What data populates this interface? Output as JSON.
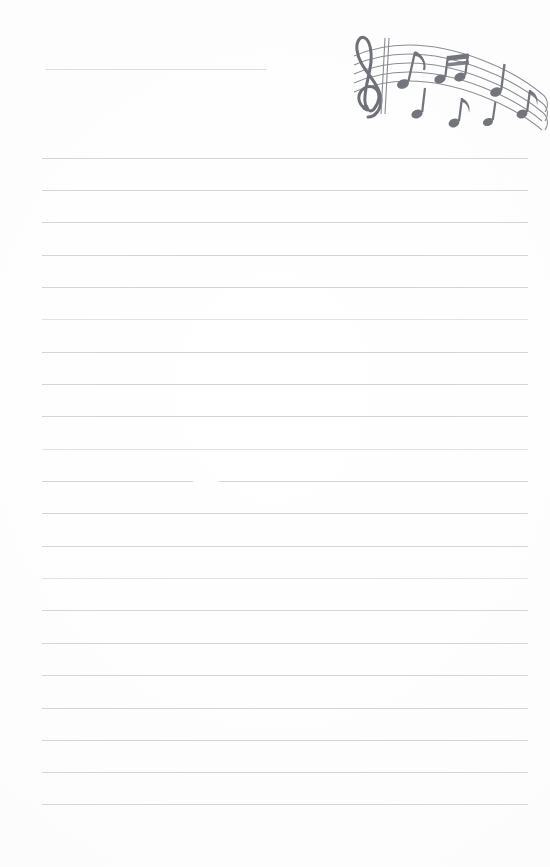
{
  "document": {
    "kind": "lined-notepaper",
    "title_line_label": "",
    "page_width": 550,
    "page_height": 867,
    "background_color": "#fefefe"
  },
  "header": {
    "title_rule": {
      "name": "title-rule",
      "x": 45,
      "y": 69,
      "width": 222,
      "color": "#d9dade"
    }
  },
  "artwork": {
    "name": "music-staff-illustration",
    "description": "Hand-drawn wavy five-line musical staff with treble clef and assorted eighth and quarter notes",
    "ink_color": "#7d7f86",
    "x": 336,
    "y": 22,
    "width": 214,
    "height": 112,
    "elements": [
      {
        "name": "treble-clef-icon",
        "symbol": "G-clef"
      },
      {
        "name": "barline"
      },
      {
        "name": "eighth-note-pair"
      },
      {
        "name": "beamed-sixteenth-notes"
      },
      {
        "name": "quarter-note"
      },
      {
        "name": "eighth-note"
      },
      {
        "name": "flagged-eighth-note"
      },
      {
        "name": "staff-lines",
        "count": 5
      }
    ]
  },
  "ruled_lines": {
    "name": "ruled-writing-lines",
    "color": "#d3d5da",
    "faint_color": "#e0e2e6",
    "left": 42,
    "right": 528,
    "count": 21,
    "first_y": 158,
    "spacing": 32.3,
    "y_positions": [
      158,
      190,
      222,
      255,
      287,
      319,
      352,
      384,
      416,
      449,
      481,
      513,
      546,
      578,
      610,
      643,
      675,
      708,
      740,
      772,
      804
    ],
    "faint_indices": [
      5,
      9,
      13
    ],
    "smudge": {
      "x": 193,
      "y": 481,
      "width": 26
    }
  },
  "content": {
    "body_text": "",
    "note": ""
  }
}
